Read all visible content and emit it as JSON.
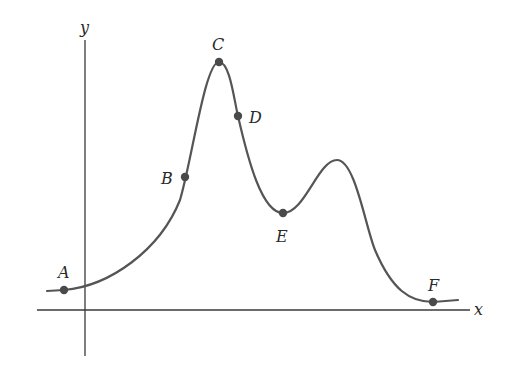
{
  "axes": {
    "x_label": "x",
    "y_label": "y",
    "color": "#3a3a3a"
  },
  "curve": {
    "color": "#555555",
    "path": "M 47 291 L 64 290 C 110 286, 160 250, 180 200 C 192 160, 205 62, 219 62 C 230 62, 234 100, 238 116 C 248 160, 262 213, 283 213 C 305 213, 318 160, 337 160 C 355 160, 365 225, 375 250 C 392 290, 410 302, 433 302 L 458 300"
  },
  "points": [
    {
      "label": "A",
      "x": 64,
      "y": 290,
      "lx": 58,
      "ly": 278
    },
    {
      "label": "B",
      "x": 185,
      "y": 177,
      "lx": 161,
      "ly": 184
    },
    {
      "label": "C",
      "x": 219,
      "y": 62,
      "lx": 212,
      "ly": 50
    },
    {
      "label": "D",
      "x": 238,
      "y": 116,
      "lx": 249,
      "ly": 123
    },
    {
      "label": "E",
      "x": 283,
      "y": 213,
      "lx": 276,
      "ly": 242
    },
    {
      "label": "F",
      "x": 433,
      "y": 302,
      "lx": 428,
      "ly": 291
    }
  ],
  "point_color": "#4a4a4a"
}
